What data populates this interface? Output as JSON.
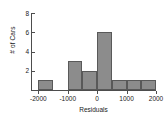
{
  "chart_data": {
    "type": "bar",
    "title": "",
    "subtitle": "",
    "xlabel": "Residuals",
    "ylabel": "# of Cars",
    "grid": false,
    "legend": false,
    "bin_width": 500,
    "xlim": [
      -2250,
      2000
    ],
    "ylim": [
      0,
      8
    ],
    "xticks": [
      -2000,
      -1000,
      0,
      1000,
      2000
    ],
    "xtick_labels": [
      "-2000",
      "-1000",
      "0",
      "1000",
      "2000"
    ],
    "yticks": [
      2,
      4,
      6,
      8
    ],
    "ytick_labels": [
      "2",
      "4",
      "6",
      "8"
    ],
    "bin_starts": [
      -2000,
      -1500,
      -1000,
      -500,
      0,
      500,
      1000,
      1500
    ],
    "categories": [
      "-2000 to -1500",
      "-1500 to -1000",
      "-1000 to -500",
      "-500 to 0",
      "0 to 500",
      "500 to 1000",
      "1000 to 1500",
      "1500 to 2000"
    ],
    "values": [
      1,
      0,
      3,
      2,
      6,
      1,
      1,
      1
    ],
    "bar_color": "#8c8c8c",
    "bar_edge_color": "#595959",
    "axis_color": "#4d4d4d",
    "text_color": "#1a1a1a",
    "background": "#ffffff"
  },
  "axes": {
    "y": {
      "label": "# of Cars",
      "ticks": [
        {
          "value": 2,
          "label": "2"
        },
        {
          "value": 4,
          "label": "4"
        },
        {
          "value": 6,
          "label": "6"
        },
        {
          "value": 8,
          "label": "8"
        }
      ]
    },
    "x": {
      "label": "Residuals",
      "ticks": [
        {
          "value": -2000,
          "label": "-2000"
        },
        {
          "value": -1000,
          "label": "-1000"
        },
        {
          "value": 0,
          "label": "0"
        },
        {
          "value": 1000,
          "label": "1000"
        },
        {
          "value": 2000,
          "label": "2000"
        }
      ]
    }
  }
}
